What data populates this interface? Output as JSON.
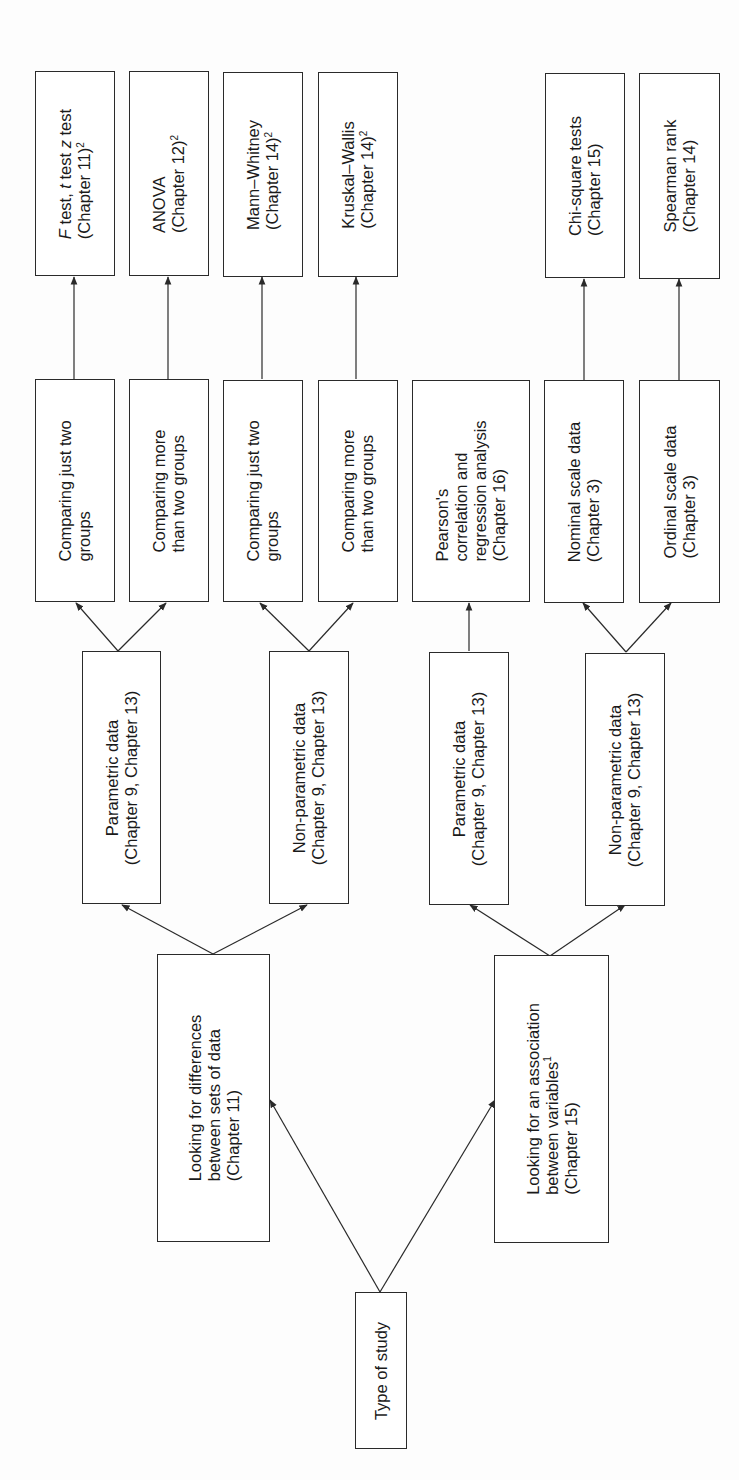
{
  "diagram": {
    "root": {
      "label": "Type of study"
    },
    "branches": [
      {
        "id": "differences",
        "lines": [
          "Looking for differences",
          "between sets of data",
          "(Chapter 11)"
        ],
        "children": [
          {
            "id": "diff-parametric",
            "lines": [
              "Parametric data",
              "(Chapter 9, Chapter 13)"
            ],
            "children": [
              {
                "id": "diff-param-two",
                "lines": [
                  "Comparing just two",
                  "groups"
                ],
                "test": {
                  "line1_italic_1": "F",
                  "line1_rest_1": " test, ",
                  "line1_italic_2": "t",
                  "line1_rest_2": " test ",
                  "line1_italic_3": "z",
                  "line1_rest_3": " test",
                  "line2": "(Chapter 11)",
                  "sup": "2"
                }
              },
              {
                "id": "diff-param-more",
                "lines": [
                  "Comparing more",
                  "than two groups"
                ],
                "test": {
                  "line1": "ANOVA",
                  "line2": "(Chapter 12)",
                  "sup": "2"
                }
              }
            ]
          },
          {
            "id": "diff-nonparametric",
            "lines": [
              "Non-parametric data",
              "(Chapter 9, Chapter 13)"
            ],
            "children": [
              {
                "id": "diff-nonparam-two",
                "lines": [
                  "Comparing just two",
                  "groups"
                ],
                "test": {
                  "line1": "Mann–Whitney",
                  "line2": "(Chapter 14)",
                  "sup": "2"
                }
              },
              {
                "id": "diff-nonparam-more",
                "lines": [
                  "Comparing more",
                  "than two groups"
                ],
                "test": {
                  "line1": "Kruskal–Wallis",
                  "line2": "(Chapter 14)",
                  "sup": "2"
                }
              }
            ]
          }
        ]
      },
      {
        "id": "association",
        "lines": [
          "Looking for an association",
          "between variables",
          "(Chapter 15)"
        ],
        "sup": "1",
        "children": [
          {
            "id": "assoc-parametric",
            "lines": [
              "Parametric data",
              "(Chapter 9, Chapter 13)"
            ],
            "children": [
              {
                "id": "assoc-pearson",
                "lines": [
                  "Pearson's",
                  "correlation and",
                  "regression analysis",
                  "(Chapter 16)"
                ]
              }
            ]
          },
          {
            "id": "assoc-nonparametric",
            "lines": [
              "Non-parametric data",
              "(Chapter 9, Chapter 13)"
            ],
            "children": [
              {
                "id": "assoc-nominal",
                "lines": [
                  "Nominal scale data",
                  "(Chapter 3)"
                ],
                "test": {
                  "line1": "Chi-square tests",
                  "line2": "(Chapter 15)"
                }
              },
              {
                "id": "assoc-ordinal",
                "lines": [
                  "Ordinal scale data",
                  "(Chapter 3)"
                ],
                "test": {
                  "line1": "Spearman rank",
                  "line2": "(Chapter 14)"
                }
              }
            ]
          }
        ]
      }
    ]
  },
  "colors": {
    "line": "#2a2a2a",
    "box_fill": "#ffffff",
    "background": "#fdfdfd"
  }
}
